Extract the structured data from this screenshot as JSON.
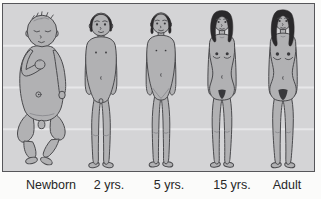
{
  "stages": [
    {
      "label": "Newborn",
      "figure": "newborn-infant"
    },
    {
      "label": "2 yrs.",
      "figure": "toddler"
    },
    {
      "label": "5 yrs.",
      "figure": "young-child"
    },
    {
      "label": "15 yrs.",
      "figure": "adolescent-female"
    },
    {
      "label": "Adult",
      "figure": "adult-female"
    }
  ],
  "colors": {
    "page_bg": "#fbfbfa",
    "panel_bg": "#d4d4d6",
    "panel_border": "#56565a",
    "grid": "#e7e7e9",
    "skin": "#b1b1b3",
    "outline": "#4a4a4d",
    "hair": "#2a292b",
    "dark": "#39393c",
    "detail": "#85858a",
    "text": "#272727"
  }
}
